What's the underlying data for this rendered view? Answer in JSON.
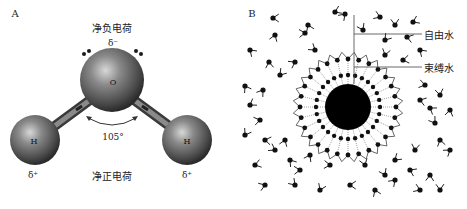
{
  "figure": {
    "panel_a": {
      "letter": "A",
      "net_negative_label": "净负电荷",
      "net_positive_label": "净正电荷",
      "oxygen_label": "O",
      "hydrogen_left_label": "H",
      "hydrogen_right_label": "H",
      "delta_minus": "δ⁻",
      "delta_plus_left": "δ⁺",
      "delta_plus_right": "δ⁺",
      "bond_angle": "105°",
      "colors": {
        "sphere": "#6a6a6a",
        "sphere_highlight": "#cfcfcf",
        "sphere_shadow": "#2a2a2a",
        "lone_pair": "#1a1a1a"
      }
    },
    "panel_b": {
      "letter": "B",
      "free_water_label": "自由水",
      "bound_water_label": "束缚水",
      "colors": {
        "particle": "#000000",
        "water_molecule": "#111111",
        "line": "#333333"
      }
    }
  }
}
